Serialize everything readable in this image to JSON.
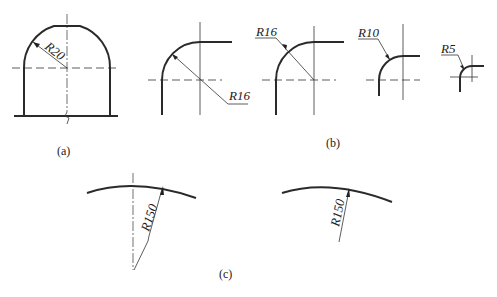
{
  "figures": {
    "a": {
      "caption": "(a)",
      "dimension": "R20"
    },
    "b": {
      "caption": "(b)",
      "dimensions": [
        "R16",
        "R16",
        "R10",
        "R5"
      ]
    },
    "c": {
      "caption": "(c)",
      "dimensions": [
        "R150",
        "R150"
      ]
    }
  }
}
